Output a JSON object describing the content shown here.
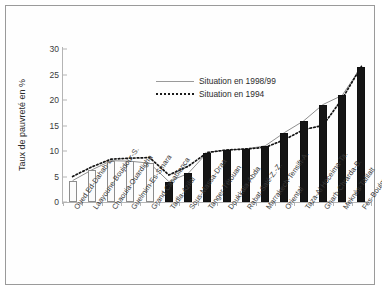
{
  "chart_data": {
    "type": "bar",
    "title": "",
    "xlabel": "",
    "ylabel": "Taux de pauvreté en %",
    "ylim": [
      0,
      30
    ],
    "yticks": [
      0,
      5,
      10,
      15,
      20,
      25,
      30
    ],
    "grid": false,
    "legend_position": "upper-center",
    "categories": [
      "Oued Ed-Dahab-L.",
      "Laayoune-Boujdour-S.",
      "Chaouia-Ouardigha",
      "Guelmim-Es-Smara",
      "Grand Casablanca",
      "Tadla-Azilal",
      "Sous-Massa-Draa",
      "Tanger-Tétouan",
      "Doukkala-Abda",
      "Rabat-Salé-Z.-Z.",
      "Marrakech-Tensift-A.",
      "Oriental",
      "Taza-Al Hoceima-Ta.",
      "Gharb-Chrarda-B.",
      "Meknès-Tafilalt",
      "Fès-Boulmane"
    ],
    "series": [
      {
        "name": "Situation en 1998/99",
        "style": "bar-and-line",
        "values": [
          4.2,
          6.3,
          8.1,
          8.0,
          7.6,
          4.0,
          5.6,
          9.7,
          10.2,
          10.4,
          11.0,
          13.6,
          15.9,
          19.1,
          20.9,
          26.5
        ]
      },
      {
        "name": "Situation en 1994",
        "style": "dotted-line",
        "values": [
          5.0,
          6.9,
          8.4,
          8.6,
          8.7,
          5.3,
          7.0,
          9.7,
          10.2,
          10.4,
          10.7,
          12.2,
          14.2,
          15.0,
          20.2,
          26.6
        ]
      }
    ]
  },
  "legend": {
    "items": [
      {
        "label": "Situation en 1998/99",
        "key": "solid"
      },
      {
        "label": "Situation en 1994",
        "key": "dash"
      }
    ]
  }
}
